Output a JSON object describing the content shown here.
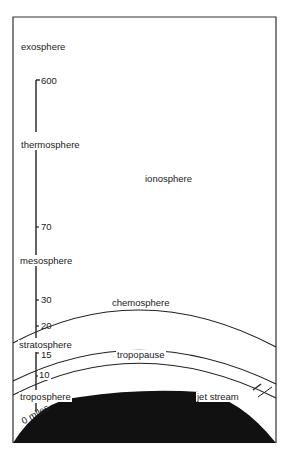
{
  "diagram": {
    "layers": [
      {
        "name": "exosphere"
      },
      {
        "name": "thermosphere"
      },
      {
        "name": "mesosphere"
      },
      {
        "name": "stratosphere"
      },
      {
        "name": "troposphere"
      }
    ],
    "regions": {
      "ionosphere": "ionosphere",
      "chemosphere": "chemosphere",
      "tropopause": "tropopause",
      "jet_stream": "jet stream"
    },
    "scale_ticks": [
      "600",
      "70",
      "30",
      "20",
      "15",
      "10",
      "0 miles"
    ],
    "colors": {
      "line": "#222222",
      "earth": "#111111",
      "background": "#ffffff"
    }
  }
}
